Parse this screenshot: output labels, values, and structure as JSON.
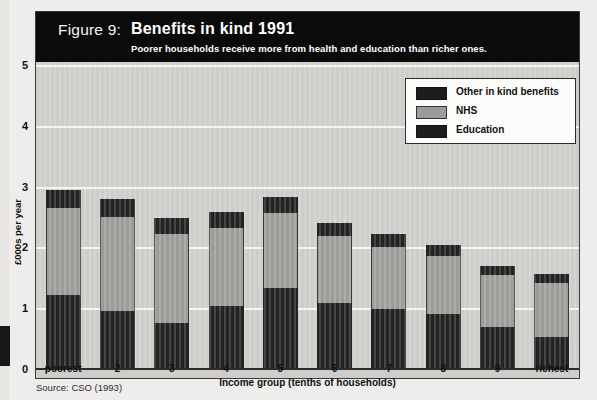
{
  "figure": {
    "number_label": "Figure 9:",
    "title": "Benefits in kind 1991",
    "subtitle": "Poorer households receive more from health and education than richer ones.",
    "source": "Source: CSO (1993)"
  },
  "legend": {
    "items": [
      {
        "label": "Other in kind benefits",
        "color": "#1d1d1d",
        "key": "other"
      },
      {
        "label": "NHS",
        "color": "#9d9c99",
        "key": "nhs"
      },
      {
        "label": "Education",
        "color": "#1d1d1d",
        "key": "education"
      }
    ]
  },
  "axes": {
    "y_title": "£000s per year",
    "y_ticks": [
      "0",
      "1",
      "2",
      "3",
      "4",
      "5"
    ],
    "x_title": "Income group (tenths of households)",
    "x_ticks": [
      "poorest",
      "2",
      "3",
      "4",
      "5",
      "6",
      "7",
      "8",
      "9",
      "richest"
    ]
  },
  "chart_data": {
    "type": "bar",
    "stacked": true,
    "title": "Benefits in kind 1991",
    "subtitle": "Poorer households receive more from health and education than richer ones.",
    "xlabel": "Income group (tenths of households)",
    "ylabel": "£000s per year",
    "ylim": [
      0,
      5
    ],
    "ytick_values": [
      0,
      1,
      2,
      3,
      4,
      5
    ],
    "grid": true,
    "grid_axis": "y",
    "legend_position": "top-right inside plot",
    "categories": [
      "poorest",
      "2",
      "3",
      "4",
      "5",
      "6",
      "7",
      "8",
      "9",
      "richest"
    ],
    "series": [
      {
        "name": "Education",
        "color": "#232323",
        "values": [
          1.23,
          0.97,
          0.77,
          1.06,
          1.35,
          1.11,
          1.01,
          0.92,
          0.7,
          0.54
        ]
      },
      {
        "name": "NHS",
        "color": "#9d9c99",
        "values": [
          1.43,
          1.54,
          1.47,
          1.28,
          1.24,
          1.1,
          1.01,
          0.96,
          0.86,
          0.89
        ]
      },
      {
        "name": "Other in kind benefits",
        "color": "#232323",
        "values": [
          0.3,
          0.3,
          0.26,
          0.26,
          0.25,
          0.21,
          0.21,
          0.18,
          0.15,
          0.15
        ]
      }
    ],
    "totals": [
      2.96,
      2.81,
      2.5,
      2.6,
      2.84,
      2.42,
      2.23,
      2.06,
      1.71,
      1.58
    ],
    "units": "£000s per year",
    "source": "Source: CSO (1993)"
  },
  "colors": {
    "banner": "#0b0b0b",
    "plot_background": "#cfcdca",
    "gridline": "#f4f3f1",
    "dark_segment": "#232323",
    "gray_segment": "#9d9c99"
  }
}
